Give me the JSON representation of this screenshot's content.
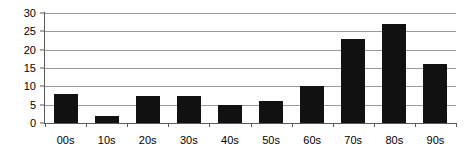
{
  "chart_data": {
    "type": "bar",
    "title": "",
    "subtitle": "",
    "xlabel": "",
    "ylabel": "",
    "categories": [
      "00s",
      "10s",
      "20s",
      "30s",
      "40s",
      "50s",
      "60s",
      "70s",
      "80s",
      "90s"
    ],
    "values": [
      8,
      2,
      7.5,
      7.5,
      5,
      6,
      10,
      23,
      27,
      16
    ],
    "series": [
      {
        "name": "",
        "values": [
          8,
          2,
          7.5,
          7.5,
          5,
          6,
          10,
          23,
          27,
          16
        ]
      }
    ],
    "ylim": [
      0,
      30
    ],
    "xlim": [
      0,
      10
    ],
    "ytick_labels": [
      "0",
      "5",
      "10",
      "15",
      "20",
      "25",
      "30"
    ],
    "ytick_values": [
      0,
      5,
      10,
      15,
      20,
      25,
      30
    ],
    "grid": true,
    "grid_axis": "y",
    "legend": false,
    "legend_position": "none",
    "annotations": [],
    "colors": {
      "bar": "#111111",
      "gridline": "#9a9a9a",
      "axis": "#5a5a5a",
      "text": "#000000",
      "background": "#ffffff"
    }
  }
}
